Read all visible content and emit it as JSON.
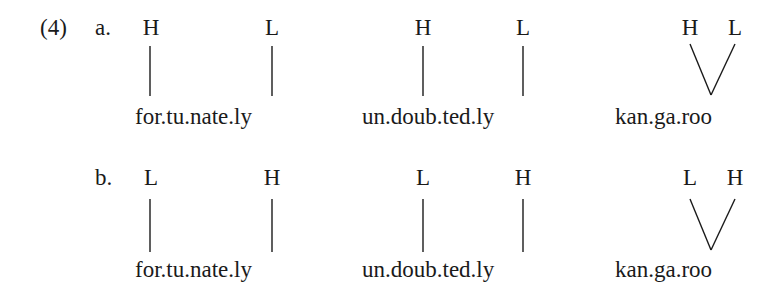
{
  "example": {
    "number": "(4)",
    "rows": [
      {
        "label": "a.",
        "items": [
          {
            "tones": [
              "H",
              "L"
            ],
            "word": "for.tu.nate.ly",
            "association": "one-to-one"
          },
          {
            "tones": [
              "H",
              "L"
            ],
            "word": "un.doub.ted.ly",
            "association": "one-to-one"
          },
          {
            "tones": [
              "H",
              "L"
            ],
            "word": "kan.ga.roo",
            "association": "two-to-one"
          }
        ]
      },
      {
        "label": "b.",
        "items": [
          {
            "tones": [
              "L",
              "H"
            ],
            "word": "for.tu.nate.ly",
            "association": "one-to-one"
          },
          {
            "tones": [
              "L",
              "H"
            ],
            "word": "un.doub.ted.ly",
            "association": "one-to-one"
          },
          {
            "tones": [
              "L",
              "H"
            ],
            "word": "kan.ga.roo",
            "association": "two-to-one"
          }
        ]
      }
    ]
  },
  "colors": {
    "text": "#1a1a1a",
    "background": "#ffffff"
  }
}
